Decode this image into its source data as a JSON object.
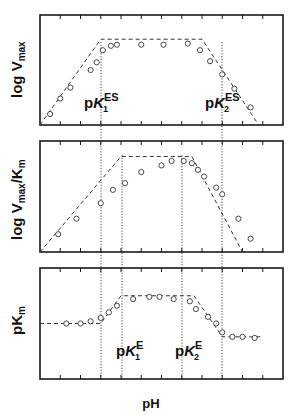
{
  "chart_data": [
    {
      "type": "line",
      "panel": "top",
      "ylabel": "log Vmax",
      "ylabel_main": "log V",
      "ylabel_sub": "max",
      "xlabel": "pH",
      "x_ticks_count": 11,
      "grid": false,
      "fit_line": [
        [
          0,
          0.0
        ],
        [
          3,
          0.78
        ],
        [
          8,
          0.78
        ],
        [
          10.8,
          0.0
        ]
      ],
      "points": [
        [
          0.5,
          0.1
        ],
        [
          1.0,
          0.24
        ],
        [
          1.5,
          0.34
        ],
        [
          2.5,
          0.5
        ],
        [
          2.8,
          0.57
        ],
        [
          3.1,
          0.68
        ],
        [
          3.5,
          0.72
        ],
        [
          3.8,
          0.73
        ],
        [
          5.0,
          0.73
        ],
        [
          6.1,
          0.73
        ],
        [
          7.3,
          0.74
        ],
        [
          7.9,
          0.68
        ],
        [
          8.4,
          0.58
        ],
        [
          9.0,
          0.46
        ],
        [
          9.6,
          0.33
        ],
        [
          10.4,
          0.16
        ]
      ],
      "annotations": [
        {
          "label": "pK1ES",
          "x": 3.0
        },
        {
          "label": "pK2ES",
          "x": 9.0
        }
      ]
    },
    {
      "type": "line",
      "panel": "middle",
      "ylabel": "log Vmax/Km",
      "ylabel_main": "log V",
      "ylabel_sub": "max",
      "ylabel_tail": "/K",
      "ylabel_sub2": "m",
      "xlabel": "pH",
      "x_ticks_count": 11,
      "grid": false,
      "fit_line": [
        [
          0,
          0.0
        ],
        [
          4.0,
          0.86
        ],
        [
          7.5,
          0.86
        ],
        [
          10.0,
          0.0
        ]
      ],
      "points": [
        [
          0.9,
          0.16
        ],
        [
          1.8,
          0.3
        ],
        [
          3.0,
          0.44
        ],
        [
          3.6,
          0.56
        ],
        [
          4.2,
          0.62
        ],
        [
          5.0,
          0.72
        ],
        [
          6.0,
          0.78
        ],
        [
          6.5,
          0.82
        ],
        [
          7.1,
          0.82
        ],
        [
          7.5,
          0.8
        ],
        [
          7.8,
          0.74
        ],
        [
          8.1,
          0.68
        ],
        [
          8.7,
          0.58
        ],
        [
          9.0,
          0.52
        ],
        [
          9.8,
          0.3
        ],
        [
          10.4,
          0.12
        ]
      ],
      "annotations": []
    },
    {
      "type": "line",
      "panel": "bottom",
      "ylabel": "pKm",
      "ylabel_main": "pK",
      "ylabel_sub": "m",
      "xlabel": "pH",
      "x_ticks_count": 11,
      "grid": false,
      "fit_line": [
        [
          0,
          0.5
        ],
        [
          3.0,
          0.5
        ],
        [
          4.0,
          0.75
        ],
        [
          7.6,
          0.75
        ],
        [
          9.0,
          0.38
        ],
        [
          11,
          0.38
        ]
      ],
      "points": [
        [
          1.3,
          0.5
        ],
        [
          2.0,
          0.5
        ],
        [
          2.5,
          0.52
        ],
        [
          3.0,
          0.55
        ],
        [
          3.4,
          0.6
        ],
        [
          3.8,
          0.66
        ],
        [
          4.6,
          0.72
        ],
        [
          5.4,
          0.74
        ],
        [
          5.9,
          0.74
        ],
        [
          6.6,
          0.72
        ],
        [
          7.4,
          0.7
        ],
        [
          7.7,
          0.63
        ],
        [
          8.3,
          0.56
        ],
        [
          8.7,
          0.5
        ],
        [
          9.0,
          0.42
        ],
        [
          9.5,
          0.38
        ],
        [
          10.0,
          0.38
        ],
        [
          10.6,
          0.37
        ]
      ],
      "annotations": [
        {
          "label": "pK1E",
          "x": 4.0
        },
        {
          "label": "pK2E",
          "x": 7.0
        }
      ]
    }
  ],
  "labels": {
    "top_ylabel_main": "log V",
    "top_ylabel_sub": "max",
    "mid_ylabel_main": "log V",
    "mid_ylabel_sub": "max",
    "mid_ylabel_tail": "/K",
    "mid_ylabel_sub2": "m",
    "bot_ylabel_main": "pK",
    "bot_ylabel_sub": "m",
    "xlabel": "pH",
    "pk1es_p": "p",
    "pk1es_K": "K",
    "pk1es_sub": "1",
    "pk1es_sup": "ES",
    "pk2es_p": "p",
    "pk2es_K": "K",
    "pk2es_sub": "2",
    "pk2es_sup": "ES",
    "pk1e_p": "p",
    "pk1e_K": "K",
    "pk1e_sub": "1",
    "pk1e_sup": "E",
    "pk2e_p": "p",
    "pk2e_K": "K",
    "pk2e_sub": "2",
    "pk2e_sup": "E"
  },
  "colors": {
    "ink": "#1a1a1a",
    "background": "#ffffff"
  }
}
